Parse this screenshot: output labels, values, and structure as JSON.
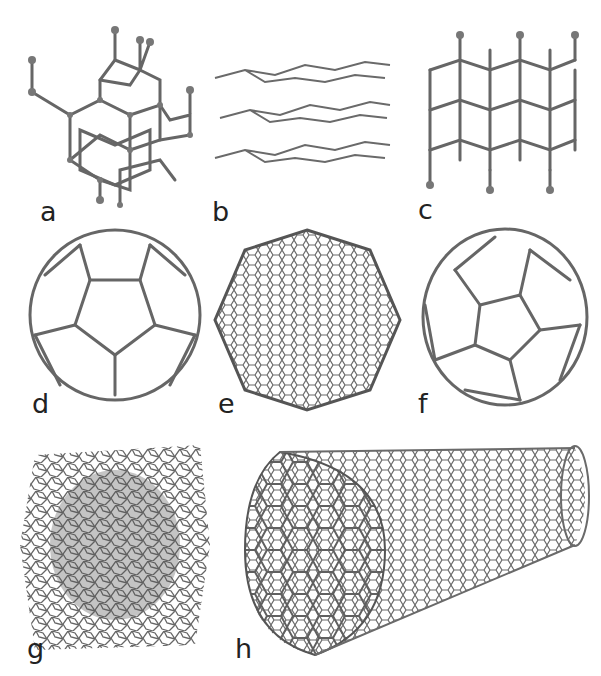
{
  "figure": {
    "panels": [
      {
        "id": "a",
        "label": "a",
        "description": "diamond"
      },
      {
        "id": "b",
        "label": "b",
        "description": "graphite"
      },
      {
        "id": "c",
        "label": "c",
        "description": "lonsdaleite"
      },
      {
        "id": "d",
        "label": "d",
        "description": "C60 buckminsterfullerene"
      },
      {
        "id": "e",
        "label": "e",
        "description": "C540 fullerene"
      },
      {
        "id": "f",
        "label": "f",
        "description": "C70 fullerene"
      },
      {
        "id": "g",
        "label": "g",
        "description": "amorphous carbon"
      },
      {
        "id": "h",
        "label": "h",
        "description": "single-walled carbon nanotube"
      }
    ],
    "colors": {
      "bond": "#666666",
      "atom": "#777777",
      "label": "#222222",
      "background": "#ffffff"
    }
  }
}
